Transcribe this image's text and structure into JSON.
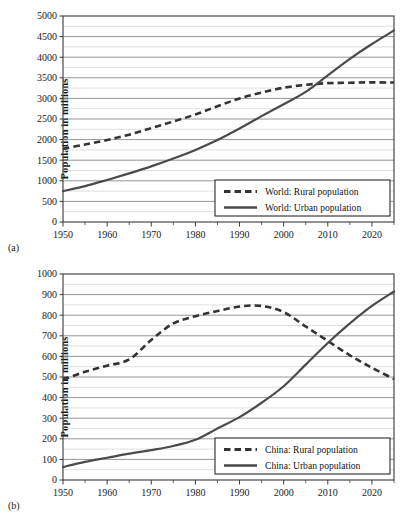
{
  "figure": {
    "panels": [
      {
        "panel_label": "(a)",
        "ylabel": "Population in millions"
      },
      {
        "panel_label": "(b)",
        "ylabel": "Population in millions"
      }
    ]
  },
  "chart_data": [
    {
      "type": "line",
      "panel": "(a)",
      "title": "",
      "xlabel": "",
      "ylabel": "Population in millions",
      "xlim": [
        1950,
        2025
      ],
      "ylim": [
        0,
        5000
      ],
      "yticks": [
        0,
        500,
        1000,
        1500,
        2000,
        2500,
        3000,
        3500,
        4000,
        4500,
        5000
      ],
      "ytick_labels": [
        "0",
        "500",
        "1000",
        "1500",
        "2000",
        "2500",
        "3000",
        "3500",
        "4000",
        "4500",
        "5000"
      ],
      "y_minor_step": 250,
      "xticks": [
        1950,
        1960,
        1970,
        1980,
        1990,
        2000,
        2010,
        2020
      ],
      "xtick_labels": [
        "1950",
        "1960",
        "1970",
        "1980",
        "1990",
        "2000",
        "2010",
        "2020"
      ],
      "x_minor_step": 5,
      "grid": true,
      "legend_position": "lower right",
      "x": [
        1950,
        1955,
        1960,
        1965,
        1970,
        1975,
        1980,
        1985,
        1990,
        1995,
        2000,
        2005,
        2010,
        2015,
        2020,
        2025
      ],
      "series": [
        {
          "name": "World: Rural population",
          "style": "dashed",
          "color": "#333333",
          "values": [
            1780,
            1880,
            1990,
            2120,
            2280,
            2440,
            2610,
            2810,
            3000,
            3140,
            3260,
            3330,
            3370,
            3380,
            3390,
            3385
          ]
        },
        {
          "name": "World: Urban population",
          "style": "solid",
          "color": "#4a4a4a",
          "values": [
            750,
            870,
            1020,
            1180,
            1350,
            1540,
            1750,
            1990,
            2270,
            2570,
            2860,
            3160,
            3560,
            3960,
            4320,
            4650
          ]
        }
      ]
    },
    {
      "type": "line",
      "panel": "(b)",
      "title": "",
      "xlabel": "",
      "ylabel": "Population in millions",
      "xlim": [
        1950,
        2025
      ],
      "ylim": [
        0,
        1000
      ],
      "yticks": [
        0,
        100,
        200,
        300,
        400,
        500,
        600,
        700,
        800,
        900,
        1000
      ],
      "ytick_labels": [
        "0",
        "100",
        "200",
        "300",
        "400",
        "500",
        "600",
        "700",
        "800",
        "900",
        "1000"
      ],
      "y_minor_step": 50,
      "xticks": [
        1950,
        1960,
        1970,
        1980,
        1990,
        2000,
        2010,
        2020
      ],
      "xtick_labels": [
        "1950",
        "1960",
        "1970",
        "1980",
        "1990",
        "2000",
        "2010",
        "2020"
      ],
      "x_minor_step": 5,
      "grid": true,
      "legend_position": "lower right",
      "x": [
        1950,
        1955,
        1960,
        1965,
        1970,
        1975,
        1980,
        1985,
        1990,
        1995,
        2000,
        2005,
        2010,
        2015,
        2020,
        2025
      ],
      "series": [
        {
          "name": "China: Rural population",
          "style": "dashed",
          "color": "#333333",
          "values": [
            487,
            525,
            555,
            585,
            680,
            760,
            795,
            820,
            842,
            845,
            815,
            745,
            675,
            605,
            545,
            490
          ]
        },
        {
          "name": "China: Urban population",
          "style": "solid",
          "color": "#4a4a4a",
          "values": [
            63,
            88,
            108,
            128,
            145,
            165,
            195,
            250,
            305,
            375,
            455,
            560,
            665,
            760,
            845,
            915
          ]
        }
      ]
    }
  ]
}
